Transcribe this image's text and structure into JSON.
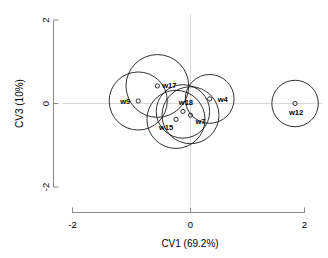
{
  "chart_data": {
    "type": "scatter",
    "title": "",
    "xlabel": "CV1 (69.2%)",
    "ylabel": "CV3 (10%)",
    "xlim": [
      -2.1,
      2.1
    ],
    "ylim": [
      -2.1,
      2.1
    ],
    "xticks": [
      -2,
      0,
      2
    ],
    "xticklabels": [
      "-2",
      "0",
      "2"
    ],
    "yticks": [
      -2,
      0,
      2
    ],
    "yticklabels": [
      "-2",
      "0",
      "2"
    ],
    "grid": false,
    "zero_reference_lines": true,
    "legend": "none",
    "marker": "open-circle",
    "circle_overlay": "confidence-circle-per-point",
    "points": [
      {
        "label": "w9",
        "x": -0.9,
        "y": 0.06,
        "r": 0.5
      },
      {
        "label": "w17",
        "x": -0.57,
        "y": 0.42,
        "r": 0.54
      },
      {
        "label": "w18",
        "x": -0.13,
        "y": -0.19,
        "r": 0.46
      },
      {
        "label": "w15",
        "x": -0.25,
        "y": -0.38,
        "r": 0.5
      },
      {
        "label": "w7",
        "x": 0.0,
        "y": -0.28,
        "r": 0.49
      },
      {
        "label": "w4",
        "x": 0.33,
        "y": 0.11,
        "r": 0.42
      },
      {
        "label": "w12",
        "x": 1.8,
        "y": 0.0,
        "r": 0.4
      }
    ]
  },
  "axes": {
    "x_title": "CV1 (69.2%)",
    "y_title": "CV3 (10%)",
    "x_tick_0": "-2",
    "x_tick_1": "0",
    "x_tick_2": "2",
    "y_tick_0": "2",
    "y_tick_1": "0",
    "y_tick_2": "-2"
  },
  "labels": {
    "w9": "w9",
    "w17": "w17",
    "w18": "w18",
    "w15": "w15",
    "w7": "w7",
    "w4": "w4",
    "w12": "w12"
  }
}
